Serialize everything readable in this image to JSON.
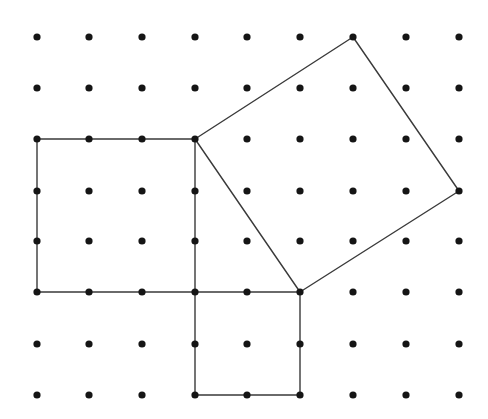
{
  "diagram": {
    "type": "dot-grid-geometry",
    "grid": {
      "columns": 9,
      "rows": 8,
      "x_positions": [
        37,
        89,
        142,
        195,
        247,
        300,
        353,
        406,
        459
      ],
      "y_positions": [
        37,
        88,
        139,
        191,
        241,
        292,
        344,
        395
      ],
      "dot_radius": 3.6,
      "dot_color": "#151515"
    },
    "line_color": "#3a3a3a",
    "shapes": [
      {
        "name": "left-square",
        "side_units": 3,
        "area": 9,
        "vertices": [
          [
            0,
            2
          ],
          [
            3,
            2
          ],
          [
            3,
            5
          ],
          [
            0,
            5
          ]
        ]
      },
      {
        "name": "bottom-square",
        "side_units": 2,
        "area": 4,
        "vertices": [
          [
            3,
            5
          ],
          [
            5,
            5
          ],
          [
            5,
            7
          ],
          [
            3,
            7
          ]
        ]
      },
      {
        "name": "tilted-square",
        "side_units": "sqrt(13)",
        "area": 13,
        "vertices": [
          [
            3,
            2
          ],
          [
            6,
            0
          ],
          [
            8,
            3
          ],
          [
            5,
            5
          ]
        ]
      }
    ]
  }
}
